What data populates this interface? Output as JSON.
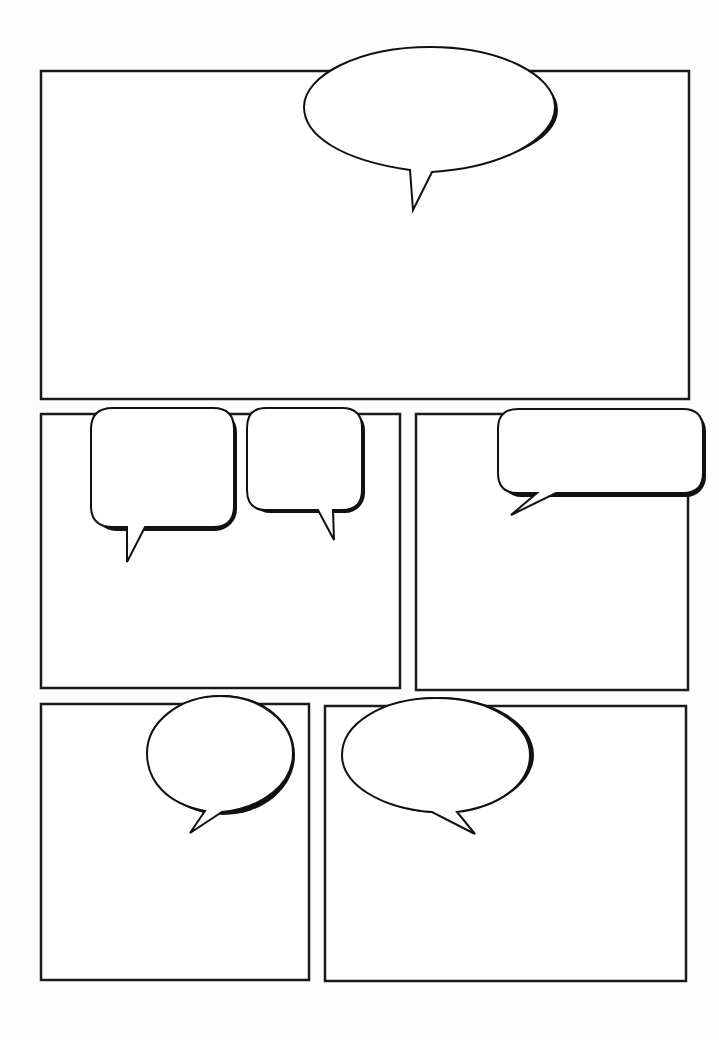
{
  "page": {
    "width": 719,
    "height": 1040,
    "background": "#fdfdfd",
    "ink_color": "#111111"
  },
  "panels": [
    {
      "id": "panel-1",
      "x": 41,
      "y": 71,
      "w": 648,
      "h": 328
    },
    {
      "id": "panel-2",
      "x": 41,
      "y": 414,
      "w": 359,
      "h": 274
    },
    {
      "id": "panel-3",
      "x": 416,
      "y": 414,
      "w": 272,
      "h": 276
    },
    {
      "id": "panel-4",
      "x": 41,
      "y": 704,
      "w": 268,
      "h": 276
    },
    {
      "id": "panel-5",
      "x": 325,
      "y": 706,
      "w": 361,
      "h": 275
    }
  ],
  "balloons": [
    {
      "id": "balloon-1",
      "shape": "ellipse",
      "text": ""
    },
    {
      "id": "balloon-2",
      "shape": "rounded-rect",
      "text": ""
    },
    {
      "id": "balloon-3",
      "shape": "rounded-rect",
      "text": ""
    },
    {
      "id": "balloon-4",
      "shape": "rounded-rect",
      "text": ""
    },
    {
      "id": "balloon-5",
      "shape": "ellipse",
      "text": ""
    },
    {
      "id": "balloon-6",
      "shape": "ellipse",
      "text": ""
    }
  ]
}
